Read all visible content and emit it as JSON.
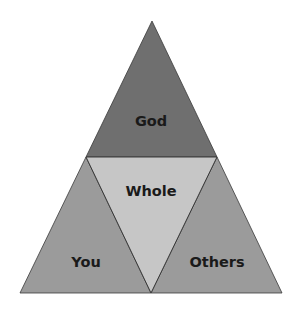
{
  "diagram": {
    "type": "triangle-pyramid",
    "sections": {
      "top": {
        "label": "God",
        "color": "#6f6f6f"
      },
      "center": {
        "label": "Whole",
        "color": "#c6c6c6"
      },
      "bottom_left": {
        "label": "You",
        "color": "#9b9b9b"
      },
      "bottom_right": {
        "label": "Others",
        "color": "#9b9b9b"
      }
    },
    "outline_color": "#3a3a3a",
    "text_color": "#1a1a1a"
  }
}
